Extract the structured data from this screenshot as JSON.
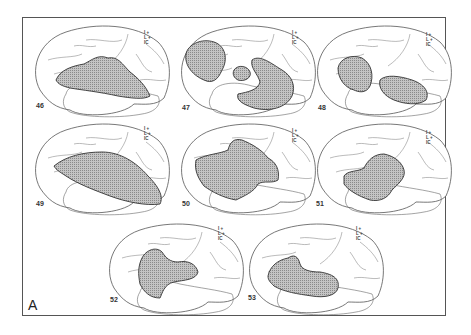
{
  "figure": {
    "label": "A",
    "panels": [
      {
        "id": "46",
        "legend": [
          "I +",
          "L +",
          "IC"
        ]
      },
      {
        "id": "47",
        "legend": [
          "I +",
          "L +",
          "IC"
        ]
      },
      {
        "id": "48",
        "legend": [
          "I +",
          "L +",
          "IC"
        ]
      },
      {
        "id": "49",
        "legend": [
          "I +",
          "L +",
          "IC"
        ]
      },
      {
        "id": "50",
        "legend": [
          "I +",
          "L +",
          "IC"
        ]
      },
      {
        "id": "51",
        "legend": [
          "I +",
          "L +",
          "IC"
        ]
      },
      {
        "id": "52",
        "legend": [
          "I +",
          "L +",
          "IC"
        ]
      },
      {
        "id": "53",
        "legend": [
          "I +",
          "L +",
          "IC"
        ]
      }
    ]
  },
  "style": {
    "lesion_fill": "#b8b8b8",
    "outline": "#555555"
  }
}
